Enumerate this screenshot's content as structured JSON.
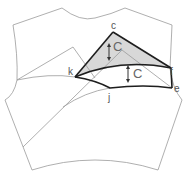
{
  "diagram": {
    "type": "sewing-pattern-bodice-dart-manipulation",
    "points": {
      "c": "c",
      "k": "k",
      "f": "f",
      "e": "e",
      "j": "j"
    },
    "measure_labels": {
      "upper": "C",
      "lower": "C"
    },
    "colors": {
      "outline": "#9a9a9a",
      "bold_line": "#1e1e1e",
      "shaded_dart": "#d8d8d8"
    }
  }
}
